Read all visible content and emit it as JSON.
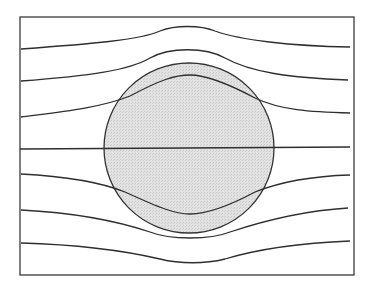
{
  "diagram": {
    "title": "",
    "canvas": {
      "width": 378,
      "height": 294
    },
    "colors": {
      "background": "#ffffff",
      "line": "#2e2e2e",
      "frame": "#3a3a3a",
      "circle_fill": "#dcdcdc",
      "circle_stroke": "#333333"
    },
    "frame": {
      "x": 20,
      "y": 17,
      "width": 334,
      "height": 258
    },
    "circle": {
      "cx": 189,
      "cy": 148,
      "r": 85
    },
    "field_lines": [
      {
        "id": "line-1",
        "d": "M 21 49 C 90 44, 140 40, 160 31 C 175 25, 200 25, 215 31 C 240 40, 290 46, 350 47"
      },
      {
        "id": "line-2",
        "d": "M 21 81 C 90 76, 130 70, 150 58 C 170 47, 205 47, 225 58 C 250 72, 290 78, 348 80"
      },
      {
        "id": "line-3",
        "d": "M 21 117 C 60 112, 100 108, 130 96 C 160 80, 175 75, 190 75 C 205 75, 225 82, 255 98 C 280 110, 310 112, 350 113"
      },
      {
        "id": "line-4",
        "d": "M 20 149 L 350 147"
      },
      {
        "id": "line-5",
        "d": "M 21 174 C 60 176, 100 182, 125 192 C 160 208, 175 214, 190 214 C 205 214, 225 208, 255 192 C 285 180, 315 176, 350 175"
      },
      {
        "id": "line-6",
        "d": "M 21 210 C 80 213, 120 222, 150 232 C 170 240, 210 240, 230 232 C 260 222, 300 211, 348 208"
      },
      {
        "id": "line-7",
        "d": "M 21 243 C 90 245, 130 252, 160 259 C 180 264, 205 264, 225 259 C 255 250, 300 243, 350 241"
      }
    ]
  }
}
